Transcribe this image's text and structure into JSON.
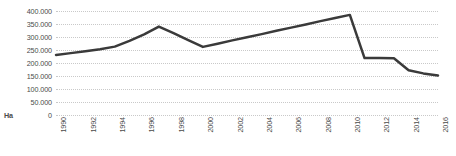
{
  "chart_data": {
    "type": "line",
    "title": "",
    "subtitle": "",
    "xlabel": "",
    "ylabel": "Ha",
    "unit_label": "Ha",
    "x": [
      1990,
      1991,
      1992,
      1993,
      1994,
      1995,
      1996,
      1997,
      1998,
      1999,
      2000,
      2001,
      2002,
      2003,
      2004,
      2005,
      2006,
      2007,
      2008,
      2009,
      2010,
      2011,
      2012,
      2013,
      2014,
      2015,
      2016
    ],
    "values": [
      231000,
      238000,
      245000,
      253000,
      263000,
      285000,
      310000,
      340000,
      315000,
      288000,
      262000,
      274000,
      287000,
      299000,
      311000,
      324000,
      336000,
      348000,
      361000,
      373000,
      385000,
      219000,
      219000,
      218000,
      172000,
      160000,
      152000
    ],
    "series": [
      {
        "name": "Area",
        "color": "#3a3a3a",
        "values": [
          231000,
          238000,
          245000,
          253000,
          263000,
          285000,
          310000,
          340000,
          315000,
          288000,
          262000,
          274000,
          287000,
          299000,
          311000,
          324000,
          336000,
          348000,
          361000,
          373000,
          385000,
          219000,
          219000,
          218000,
          172000,
          160000,
          152000
        ]
      }
    ],
    "xlim": [
      1990,
      2016
    ],
    "ylim": [
      0,
      400000
    ],
    "y_ticks": [
      0,
      50000,
      100000,
      150000,
      200000,
      250000,
      300000,
      350000,
      400000
    ],
    "y_tick_labels": [
      "0",
      "50.000",
      "100.000",
      "150.000",
      "200.000",
      "250.000",
      "300.000",
      "350.000",
      "400.000"
    ],
    "x_ticks": [
      1990,
      1992,
      1994,
      1996,
      1998,
      2000,
      2002,
      2004,
      2006,
      2008,
      2010,
      2012,
      2014,
      2016
    ],
    "x_tick_labels": [
      "1990",
      "1992",
      "1994",
      "1996",
      "1998",
      "2000",
      "2002",
      "2004",
      "2006",
      "2008",
      "2010",
      "2012",
      "2014",
      "2016"
    ],
    "grid": true,
    "grid_axis": "y",
    "grid_style": "dotted",
    "grid_color": "#c9c9c9",
    "legend": false,
    "legend_position": "none",
    "line_color": "#3a3a3a",
    "line_width": 2.5,
    "markers": false,
    "background_color": "#ffffff",
    "text_color": "#4a4a4a",
    "annotations": []
  }
}
